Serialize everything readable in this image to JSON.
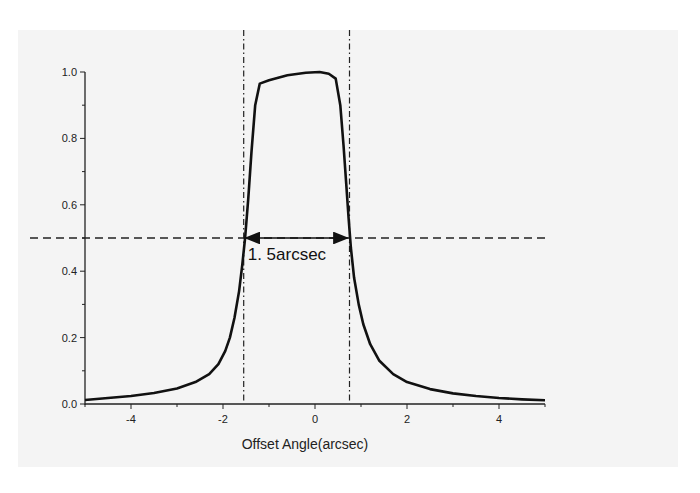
{
  "chart_data": {
    "type": "line",
    "title": "",
    "xlabel": "Offset Angle(arcsec)",
    "ylabel": "",
    "xlim": [
      -5,
      5
    ],
    "ylim": [
      0,
      1.0
    ],
    "grid": false,
    "legend": null,
    "x_ticks": [
      -4,
      -2,
      0,
      2,
      4
    ],
    "x_tick_labels": [
      "-4",
      "-2",
      "0",
      "2",
      "4"
    ],
    "x_minor_ticks": [
      -5,
      -3,
      -1,
      1,
      3,
      5
    ],
    "y_ticks": [
      0.0,
      0.2,
      0.4,
      0.6,
      0.8,
      1.0
    ],
    "y_tick_labels": [
      "0.0",
      "0.2",
      "0.4",
      "0.6",
      "0.8",
      "1.0"
    ],
    "y_minor_ticks": [
      0.1,
      0.3,
      0.5,
      0.7,
      0.9
    ],
    "series": [
      {
        "name": "Normalized response",
        "style": "solid",
        "x": [
          -5.0,
          -4.5,
          -4.0,
          -3.5,
          -3.0,
          -2.6,
          -2.3,
          -2.1,
          -1.95,
          -1.85,
          -1.75,
          -1.65,
          -1.58,
          -1.52,
          -1.45,
          -1.38,
          -1.3,
          -1.2,
          -1.0,
          -0.6,
          -0.2,
          0.1,
          0.3,
          0.45,
          0.55,
          0.62,
          0.68,
          0.73,
          0.78,
          0.85,
          0.95,
          1.05,
          1.2,
          1.4,
          1.7,
          2.0,
          2.5,
          3.0,
          3.5,
          4.0,
          4.5,
          5.0
        ],
        "y": [
          0.012,
          0.018,
          0.024,
          0.033,
          0.047,
          0.066,
          0.09,
          0.12,
          0.16,
          0.2,
          0.26,
          0.34,
          0.42,
          0.5,
          0.62,
          0.76,
          0.9,
          0.965,
          0.975,
          0.99,
          0.998,
          1.0,
          0.995,
          0.98,
          0.9,
          0.78,
          0.66,
          0.56,
          0.47,
          0.38,
          0.3,
          0.24,
          0.18,
          0.13,
          0.09,
          0.066,
          0.045,
          0.032,
          0.024,
          0.018,
          0.014,
          0.011
        ]
      }
    ],
    "reference_lines": [
      {
        "orientation": "horizontal",
        "value": 0.5,
        "style": "dashed"
      },
      {
        "orientation": "vertical",
        "value": -1.55,
        "style": "dash-dot"
      },
      {
        "orientation": "vertical",
        "value": 0.75,
        "style": "dash-dot"
      }
    ],
    "annotations": [
      {
        "text": "1. 5arcsec",
        "type": "double-arrow",
        "x_from": -1.55,
        "x_to": 0.75,
        "y": 0.5
      }
    ]
  },
  "labels": {
    "xlabel": "Offset Angle(arcsec)",
    "annotation": "1. 5arcsec"
  }
}
